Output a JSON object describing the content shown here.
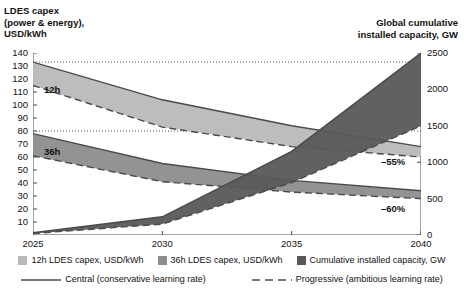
{
  "header": {
    "left_title": "LDES capex\n(power & energy),\nUSD/kWh",
    "left_line1": "LDES capex",
    "left_line2": "(power & energy),",
    "left_line3": "USD/kWh",
    "right_line1": "Global cumulative",
    "right_line2": "installed capacity, GW"
  },
  "annotations": {
    "band12h": "12h",
    "band36h": "36h",
    "drop55": "–55%",
    "drop60": "–60%"
  },
  "legend": {
    "items": [
      {
        "label": "12h LDES capex, USD/kWh",
        "color": "#b9b9b9",
        "icon": "square-swatch"
      },
      {
        "label": "36h LDES capex, USD/kWh",
        "color": "#8d8d8d",
        "icon": "square-swatch"
      },
      {
        "label": "Cumulative installed capacity, GW",
        "color": "#595959",
        "icon": "square-swatch"
      }
    ],
    "lines": [
      {
        "label": "Central (conservative learning rate)",
        "style": "solid",
        "icon": "solid-line-key"
      },
      {
        "label": "Progressive (ambitious learning rate)",
        "style": "dashed",
        "icon": "dashed-line-key"
      }
    ]
  },
  "chart_data": {
    "type": "area",
    "title": "",
    "xlabel": "",
    "x": [
      2025,
      2030,
      2035,
      2040
    ],
    "xticks": [
      "2025",
      "2030",
      "2035",
      "2040"
    ],
    "left_axis": {
      "label": "LDES capex (power & energy), USD/kWh",
      "ylim": [
        0,
        140
      ],
      "ticks": [
        10,
        20,
        30,
        40,
        50,
        60,
        70,
        80,
        90,
        100,
        110,
        120,
        130,
        140
      ]
    },
    "right_axis": {
      "label": "Global cumulative installed capacity, GW",
      "ylim": [
        0,
        2500
      ],
      "ticks": [
        0,
        500,
        1000,
        1500,
        2000,
        2500
      ]
    },
    "gridlines": {
      "style": "dotted",
      "left_values": [
        133,
        80
      ]
    },
    "series": [
      {
        "name": "12h LDES capex, USD/kWh",
        "axis": "left",
        "color": "#b9b9b9",
        "central": {
          "name": "Central (conservative learning rate)",
          "style": "solid",
          "values": [
            133,
            104,
            84,
            68
          ]
        },
        "progressive": {
          "name": "Progressive (ambitious learning rate)",
          "style": "dashed",
          "values": [
            115,
            83,
            68,
            60
          ]
        },
        "end_change_pct": -55
      },
      {
        "name": "36h LDES capex, USD/kWh",
        "axis": "left",
        "color": "#8d8d8d",
        "central": {
          "name": "Central (conservative learning rate)",
          "style": "solid",
          "values": [
            78,
            55,
            42,
            34
          ]
        },
        "progressive": {
          "name": "Progressive (ambitious learning rate)",
          "style": "dashed",
          "values": [
            61,
            41,
            33,
            28
          ]
        },
        "end_change_pct": -60
      },
      {
        "name": "Cumulative installed capacity, GW",
        "axis": "right",
        "color": "#595959",
        "central": {
          "name": "Central (conservative learning rate)",
          "style": "solid",
          "values": [
            30,
            250,
            1150,
            2500
          ]
        },
        "progressive": {
          "name": "Progressive (ambitious learning rate)",
          "style": "dashed",
          "values": [
            20,
            150,
            720,
            1500
          ]
        }
      }
    ]
  }
}
